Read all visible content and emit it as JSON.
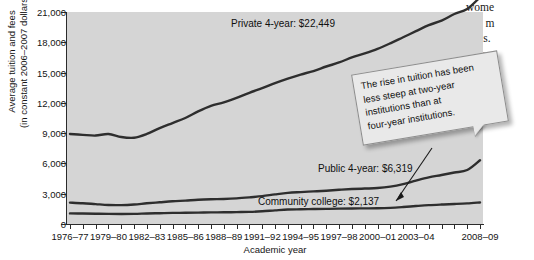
{
  "page": {
    "body_text_fragment": [
      "wome",
      "and m",
      "tuals.",
      "fem"
    ]
  },
  "chart_data": {
    "type": "line",
    "title": "",
    "xlabel": "Academic year",
    "ylabel": "Average tuition and fees (in constant 2006–2007 dollars)",
    "ylabel_line1": "Average tuition and fees",
    "ylabel_line2": "(in constant 2006–2007 dollars)",
    "ylim": [
      0,
      21000
    ],
    "ytick_labels": [
      "0",
      "3,000",
      "6,000",
      "9,000",
      "12,000",
      "15,000",
      "18,000",
      "21,000"
    ],
    "ytick_values": [
      0,
      3000,
      6000,
      9000,
      12000,
      15000,
      18000,
      21000
    ],
    "grid": false,
    "legend_position": "inline-direct-labels",
    "xtick_labels": [
      "1976–77",
      "1979–80",
      "1982–83",
      "1985–86",
      "1988–89",
      "1991–92",
      "1994–95",
      "1997–98",
      "2000–01",
      "2003–04",
      "2008–09"
    ],
    "x": [
      "1976-77",
      "1977-78",
      "1978-79",
      "1979-80",
      "1980-81",
      "1981-82",
      "1982-83",
      "1983-84",
      "1984-85",
      "1985-86",
      "1986-87",
      "1987-88",
      "1988-89",
      "1989-90",
      "1990-91",
      "1991-92",
      "1992-93",
      "1993-94",
      "1994-95",
      "1995-96",
      "1996-97",
      "1997-98",
      "1998-99",
      "1999-00",
      "2000-01",
      "2001-02",
      "2002-03",
      "2003-04",
      "2004-05",
      "2005-06",
      "2006-07",
      "2007-08",
      "2008-09"
    ],
    "series": [
      {
        "name": "Private 4-year",
        "label": "Private 4-year: $22,449",
        "final_value": 22449,
        "color": "#2e2e2e",
        "values": [
          8920,
          8830,
          8760,
          8920,
          8620,
          8550,
          8920,
          9500,
          10000,
          10500,
          11150,
          11700,
          12050,
          12500,
          13000,
          13450,
          13950,
          14400,
          14800,
          15150,
          15600,
          16000,
          16500,
          16900,
          17350,
          17900,
          18500,
          19100,
          19700,
          20150,
          20800,
          21300,
          22449
        ]
      },
      {
        "name": "Public 4-year",
        "label": "Public 4-year: $6,319",
        "final_value": 6319,
        "color": "#2e2e2e",
        "values": [
          2120,
          2060,
          1970,
          1880,
          1870,
          1930,
          2050,
          2150,
          2250,
          2320,
          2400,
          2450,
          2480,
          2540,
          2640,
          2760,
          2930,
          3080,
          3160,
          3230,
          3300,
          3390,
          3460,
          3510,
          3560,
          3700,
          3950,
          4300,
          4620,
          4850,
          5100,
          5350,
          6319
        ]
      },
      {
        "name": "Community college",
        "label": "Community college: $2,137",
        "final_value": 2137,
        "color": "#2e2e2e",
        "values": [
          1050,
          1040,
          1020,
          1000,
          990,
          1000,
          1040,
          1070,
          1100,
          1110,
          1130,
          1150,
          1160,
          1180,
          1200,
          1260,
          1350,
          1430,
          1460,
          1480,
          1500,
          1520,
          1540,
          1550,
          1560,
          1600,
          1680,
          1780,
          1870,
          1930,
          1980,
          2040,
          2137
        ]
      }
    ],
    "annotation": {
      "text": "The rise in tuition has been less steep at two-year institutions than at four-year institutions.",
      "lines": [
        "The rise in tuition has been",
        "less steep at two-year",
        "institutions than at",
        "four-year institutions."
      ],
      "points_to": "Community college"
    },
    "colors": {
      "plot_background": "#d5d5d5",
      "line": "#2e2e2e",
      "axis": "#2b2b2b",
      "callout_background": "#e9e9e9",
      "callout_border": "#8d8d8d"
    }
  }
}
